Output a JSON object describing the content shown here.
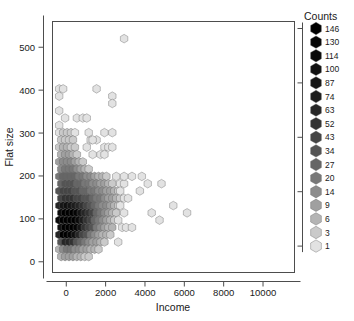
{
  "chart_data": {
    "type": "scatter",
    "subtype": "hexbin",
    "title": "",
    "xlabel": "Income",
    "ylabel": "Flat size",
    "xlim": [
      -700,
      11600
    ],
    "ylim": [
      -25,
      560
    ],
    "xticks": [
      0,
      2000,
      4000,
      6000,
      8000,
      10000
    ],
    "xticklabels": [
      "0",
      "2000",
      "4000",
      "6000",
      "8000",
      "10000"
    ],
    "yticks": [
      0,
      100,
      200,
      300,
      400,
      500
    ],
    "yticklabels": [
      "0",
      "100",
      "200",
      "300",
      "400",
      "500"
    ],
    "grid": false,
    "legend": {
      "title": "Counts",
      "position": "right",
      "entries": [
        {
          "value": 146,
          "color": "#000000"
        },
        {
          "value": 130,
          "color": "#050505"
        },
        {
          "value": 114,
          "color": "#0a0a0a"
        },
        {
          "value": 100,
          "color": "#101010"
        },
        {
          "value": 87,
          "color": "#161616"
        },
        {
          "value": 74,
          "color": "#1d1d1d"
        },
        {
          "value": 63,
          "color": "#262626"
        },
        {
          "value": 52,
          "color": "#333333"
        },
        {
          "value": 43,
          "color": "#454545"
        },
        {
          "value": 34,
          "color": "#545454"
        },
        {
          "value": 27,
          "color": "#666666"
        },
        {
          "value": 20,
          "color": "#787878"
        },
        {
          "value": 14,
          "color": "#8c8c8c"
        },
        {
          "value": 9,
          "color": "#a0a0a0"
        },
        {
          "value": 6,
          "color": "#b4b4b4"
        },
        {
          "value": 3,
          "color": "#cacaca"
        },
        {
          "value": 1,
          "color": "#e2e2e2"
        }
      ]
    },
    "hex_radius_px": 4.3,
    "bins": [
      {
        "x": -360,
        "y": 403,
        "c": 2
      },
      {
        "x": -360,
        "y": 386,
        "c": 1
      },
      {
        "x": -160,
        "y": 403,
        "c": 2
      },
      {
        "x": -360,
        "y": 352,
        "c": 1
      },
      {
        "x": -360,
        "y": 318,
        "c": 1
      },
      {
        "x": -360,
        "y": 301,
        "c": 2
      },
      {
        "x": -160,
        "y": 301,
        "c": 3
      },
      {
        "x": 40,
        "y": 301,
        "c": 3
      },
      {
        "x": 240,
        "y": 301,
        "c": 3
      },
      {
        "x": 440,
        "y": 301,
        "c": 2
      },
      {
        "x": -60,
        "y": 335,
        "c": 1
      },
      {
        "x": 540,
        "y": 335,
        "c": 2
      },
      {
        "x": 840,
        "y": 335,
        "c": 2
      },
      {
        "x": 1040,
        "y": 335,
        "c": 2
      },
      {
        "x": 1540,
        "y": 403,
        "c": 2
      },
      {
        "x": 2340,
        "y": 386,
        "c": 2
      },
      {
        "x": 2340,
        "y": 369,
        "c": 1
      },
      {
        "x": 2940,
        "y": 520,
        "c": 1
      },
      {
        "x": -260,
        "y": 284,
        "c": 3
      },
      {
        "x": -60,
        "y": 284,
        "c": 4
      },
      {
        "x": 140,
        "y": 284,
        "c": 4
      },
      {
        "x": 340,
        "y": 284,
        "c": 3
      },
      {
        "x": -360,
        "y": 267,
        "c": 4
      },
      {
        "x": -160,
        "y": 267,
        "c": 6
      },
      {
        "x": 40,
        "y": 267,
        "c": 6
      },
      {
        "x": 240,
        "y": 267,
        "c": 5
      },
      {
        "x": 440,
        "y": 267,
        "c": 3
      },
      {
        "x": -260,
        "y": 250,
        "c": 6
      },
      {
        "x": -60,
        "y": 250,
        "c": 9
      },
      {
        "x": 140,
        "y": 250,
        "c": 9
      },
      {
        "x": 340,
        "y": 250,
        "c": 6
      },
      {
        "x": 540,
        "y": 250,
        "c": 4
      },
      {
        "x": -360,
        "y": 233,
        "c": 9
      },
      {
        "x": -160,
        "y": 233,
        "c": 14
      },
      {
        "x": 40,
        "y": 233,
        "c": 14
      },
      {
        "x": 240,
        "y": 233,
        "c": 14
      },
      {
        "x": 440,
        "y": 233,
        "c": 9
      },
      {
        "x": 640,
        "y": 233,
        "c": 6
      },
      {
        "x": 840,
        "y": 233,
        "c": 3
      },
      {
        "x": -260,
        "y": 216,
        "c": 14
      },
      {
        "x": -60,
        "y": 216,
        "c": 20
      },
      {
        "x": 140,
        "y": 216,
        "c": 20
      },
      {
        "x": 340,
        "y": 216,
        "c": 20
      },
      {
        "x": 540,
        "y": 216,
        "c": 14
      },
      {
        "x": 740,
        "y": 216,
        "c": 9
      },
      {
        "x": 940,
        "y": 216,
        "c": 6
      },
      {
        "x": 1140,
        "y": 216,
        "c": 3
      },
      {
        "x": -360,
        "y": 199,
        "c": 20
      },
      {
        "x": -160,
        "y": 199,
        "c": 27
      },
      {
        "x": 40,
        "y": 199,
        "c": 27
      },
      {
        "x": 240,
        "y": 199,
        "c": 27
      },
      {
        "x": 440,
        "y": 199,
        "c": 27
      },
      {
        "x": 640,
        "y": 199,
        "c": 20
      },
      {
        "x": 840,
        "y": 199,
        "c": 20
      },
      {
        "x": 1040,
        "y": 199,
        "c": 14
      },
      {
        "x": 1240,
        "y": 199,
        "c": 14
      },
      {
        "x": 1440,
        "y": 199,
        "c": 9
      },
      {
        "x": 1640,
        "y": 199,
        "c": 6
      },
      {
        "x": 1840,
        "y": 199,
        "c": 6
      },
      {
        "x": 2040,
        "y": 199,
        "c": 3
      },
      {
        "x": -260,
        "y": 182,
        "c": 27
      },
      {
        "x": -60,
        "y": 182,
        "c": 34
      },
      {
        "x": 140,
        "y": 182,
        "c": 34
      },
      {
        "x": 340,
        "y": 182,
        "c": 34
      },
      {
        "x": 540,
        "y": 182,
        "c": 27
      },
      {
        "x": 740,
        "y": 182,
        "c": 27
      },
      {
        "x": 940,
        "y": 182,
        "c": 20
      },
      {
        "x": 1140,
        "y": 182,
        "c": 20
      },
      {
        "x": 1340,
        "y": 182,
        "c": 14
      },
      {
        "x": 1540,
        "y": 182,
        "c": 14
      },
      {
        "x": 1740,
        "y": 182,
        "c": 9
      },
      {
        "x": 1940,
        "y": 182,
        "c": 9
      },
      {
        "x": 2140,
        "y": 182,
        "c": 6
      },
      {
        "x": 2340,
        "y": 182,
        "c": 3
      },
      {
        "x": -360,
        "y": 165,
        "c": 34
      },
      {
        "x": -160,
        "y": 165,
        "c": 43
      },
      {
        "x": 40,
        "y": 165,
        "c": 43
      },
      {
        "x": 240,
        "y": 165,
        "c": 43
      },
      {
        "x": 440,
        "y": 165,
        "c": 34
      },
      {
        "x": 640,
        "y": 165,
        "c": 34
      },
      {
        "x": 840,
        "y": 165,
        "c": 27
      },
      {
        "x": 1040,
        "y": 165,
        "c": 27
      },
      {
        "x": 1240,
        "y": 165,
        "c": 20
      },
      {
        "x": 1440,
        "y": 165,
        "c": 20
      },
      {
        "x": 1640,
        "y": 165,
        "c": 14
      },
      {
        "x": 1840,
        "y": 165,
        "c": 14
      },
      {
        "x": 2040,
        "y": 165,
        "c": 9
      },
      {
        "x": 2240,
        "y": 165,
        "c": 9
      },
      {
        "x": 2440,
        "y": 165,
        "c": 6
      },
      {
        "x": 2640,
        "y": 165,
        "c": 3
      },
      {
        "x": -260,
        "y": 148,
        "c": 43
      },
      {
        "x": -60,
        "y": 148,
        "c": 52
      },
      {
        "x": 140,
        "y": 148,
        "c": 52
      },
      {
        "x": 340,
        "y": 148,
        "c": 52
      },
      {
        "x": 540,
        "y": 148,
        "c": 43
      },
      {
        "x": 740,
        "y": 148,
        "c": 43
      },
      {
        "x": 940,
        "y": 148,
        "c": 34
      },
      {
        "x": 1140,
        "y": 148,
        "c": 34
      },
      {
        "x": 1340,
        "y": 148,
        "c": 27
      },
      {
        "x": 1540,
        "y": 148,
        "c": 20
      },
      {
        "x": 1740,
        "y": 148,
        "c": 20
      },
      {
        "x": 1940,
        "y": 148,
        "c": 14
      },
      {
        "x": 2140,
        "y": 148,
        "c": 9
      },
      {
        "x": 2340,
        "y": 148,
        "c": 9
      },
      {
        "x": 2540,
        "y": 148,
        "c": 6
      },
      {
        "x": 2740,
        "y": 148,
        "c": 3
      },
      {
        "x": -360,
        "y": 131,
        "c": 63
      },
      {
        "x": -160,
        "y": 131,
        "c": 87
      },
      {
        "x": 40,
        "y": 131,
        "c": 100
      },
      {
        "x": 240,
        "y": 131,
        "c": 87
      },
      {
        "x": 440,
        "y": 131,
        "c": 74
      },
      {
        "x": 640,
        "y": 131,
        "c": 63
      },
      {
        "x": 840,
        "y": 131,
        "c": 52
      },
      {
        "x": 1040,
        "y": 131,
        "c": 43
      },
      {
        "x": 1240,
        "y": 131,
        "c": 34
      },
      {
        "x": 1440,
        "y": 131,
        "c": 27
      },
      {
        "x": 1640,
        "y": 131,
        "c": 20
      },
      {
        "x": 1840,
        "y": 131,
        "c": 14
      },
      {
        "x": 2040,
        "y": 131,
        "c": 14
      },
      {
        "x": 2240,
        "y": 131,
        "c": 9
      },
      {
        "x": 2440,
        "y": 131,
        "c": 6
      },
      {
        "x": 2640,
        "y": 131,
        "c": 3
      },
      {
        "x": -260,
        "y": 114,
        "c": 114
      },
      {
        "x": -60,
        "y": 114,
        "c": 146
      },
      {
        "x": 140,
        "y": 114,
        "c": 146
      },
      {
        "x": 340,
        "y": 114,
        "c": 146
      },
      {
        "x": 540,
        "y": 114,
        "c": 130
      },
      {
        "x": 740,
        "y": 114,
        "c": 87
      },
      {
        "x": 940,
        "y": 114,
        "c": 63
      },
      {
        "x": 1140,
        "y": 114,
        "c": 52
      },
      {
        "x": 1340,
        "y": 114,
        "c": 43
      },
      {
        "x": 1540,
        "y": 114,
        "c": 27
      },
      {
        "x": 1740,
        "y": 114,
        "c": 20
      },
      {
        "x": 1940,
        "y": 114,
        "c": 14
      },
      {
        "x": 2140,
        "y": 114,
        "c": 9
      },
      {
        "x": 2340,
        "y": 114,
        "c": 6
      },
      {
        "x": 2540,
        "y": 114,
        "c": 3
      },
      {
        "x": -360,
        "y": 97,
        "c": 114
      },
      {
        "x": -160,
        "y": 97,
        "c": 146
      },
      {
        "x": 40,
        "y": 97,
        "c": 146
      },
      {
        "x": 240,
        "y": 97,
        "c": 146
      },
      {
        "x": 440,
        "y": 97,
        "c": 146
      },
      {
        "x": 640,
        "y": 97,
        "c": 114
      },
      {
        "x": 840,
        "y": 97,
        "c": 74
      },
      {
        "x": 1040,
        "y": 97,
        "c": 52
      },
      {
        "x": 1240,
        "y": 97,
        "c": 43
      },
      {
        "x": 1440,
        "y": 97,
        "c": 27
      },
      {
        "x": 1640,
        "y": 97,
        "c": 20
      },
      {
        "x": 1840,
        "y": 97,
        "c": 14
      },
      {
        "x": 2040,
        "y": 97,
        "c": 9
      },
      {
        "x": 2240,
        "y": 97,
        "c": 6
      },
      {
        "x": 2440,
        "y": 97,
        "c": 3
      },
      {
        "x": -260,
        "y": 80,
        "c": 100
      },
      {
        "x": -60,
        "y": 80,
        "c": 146
      },
      {
        "x": 140,
        "y": 80,
        "c": 146
      },
      {
        "x": 340,
        "y": 80,
        "c": 146
      },
      {
        "x": 540,
        "y": 80,
        "c": 130
      },
      {
        "x": 740,
        "y": 80,
        "c": 87
      },
      {
        "x": 940,
        "y": 80,
        "c": 52
      },
      {
        "x": 1140,
        "y": 80,
        "c": 43
      },
      {
        "x": 1340,
        "y": 80,
        "c": 34
      },
      {
        "x": 1540,
        "y": 80,
        "c": 20
      },
      {
        "x": 1740,
        "y": 80,
        "c": 14
      },
      {
        "x": 1940,
        "y": 80,
        "c": 9
      },
      {
        "x": 2140,
        "y": 80,
        "c": 6
      },
      {
        "x": 2340,
        "y": 80,
        "c": 6
      },
      {
        "x": -360,
        "y": 63,
        "c": 63
      },
      {
        "x": -160,
        "y": 63,
        "c": 146
      },
      {
        "x": 40,
        "y": 63,
        "c": 146
      },
      {
        "x": 240,
        "y": 63,
        "c": 130
      },
      {
        "x": 440,
        "y": 63,
        "c": 100
      },
      {
        "x": 640,
        "y": 63,
        "c": 63
      },
      {
        "x": 840,
        "y": 63,
        "c": 43
      },
      {
        "x": 1040,
        "y": 63,
        "c": 34
      },
      {
        "x": 1240,
        "y": 63,
        "c": 20
      },
      {
        "x": 1440,
        "y": 63,
        "c": 14
      },
      {
        "x": 1640,
        "y": 63,
        "c": 9
      },
      {
        "x": 1840,
        "y": 63,
        "c": 6
      },
      {
        "x": 2040,
        "y": 63,
        "c": 6
      },
      {
        "x": 2240,
        "y": 63,
        "c": 3
      },
      {
        "x": -260,
        "y": 46,
        "c": 34
      },
      {
        "x": -60,
        "y": 46,
        "c": 63
      },
      {
        "x": 140,
        "y": 46,
        "c": 63
      },
      {
        "x": 340,
        "y": 46,
        "c": 52
      },
      {
        "x": 540,
        "y": 46,
        "c": 34
      },
      {
        "x": 740,
        "y": 46,
        "c": 27
      },
      {
        "x": 940,
        "y": 46,
        "c": 20
      },
      {
        "x": 1140,
        "y": 46,
        "c": 14
      },
      {
        "x": 1340,
        "y": 46,
        "c": 9
      },
      {
        "x": 1540,
        "y": 46,
        "c": 9
      },
      {
        "x": 1740,
        "y": 46,
        "c": 6
      },
      {
        "x": 1940,
        "y": 46,
        "c": 3
      },
      {
        "x": -360,
        "y": 29,
        "c": 6
      },
      {
        "x": -160,
        "y": 29,
        "c": 14
      },
      {
        "x": 40,
        "y": 29,
        "c": 20
      },
      {
        "x": 240,
        "y": 29,
        "c": 20
      },
      {
        "x": 440,
        "y": 29,
        "c": 14
      },
      {
        "x": 640,
        "y": 29,
        "c": 14
      },
      {
        "x": 840,
        "y": 29,
        "c": 9
      },
      {
        "x": 1040,
        "y": 29,
        "c": 9
      },
      {
        "x": 1240,
        "y": 29,
        "c": 6
      },
      {
        "x": 1440,
        "y": 29,
        "c": 6
      },
      {
        "x": 1640,
        "y": 29,
        "c": 3
      },
      {
        "x": -260,
        "y": 12,
        "c": 6
      },
      {
        "x": -60,
        "y": 12,
        "c": 9
      },
      {
        "x": 140,
        "y": 12,
        "c": 9
      },
      {
        "x": 340,
        "y": 12,
        "c": 9
      },
      {
        "x": 540,
        "y": 12,
        "c": 6
      },
      {
        "x": 740,
        "y": 12,
        "c": 6
      },
      {
        "x": 940,
        "y": 12,
        "c": 3
      },
      {
        "x": 1140,
        "y": 12,
        "c": 3
      },
      {
        "x": 2540,
        "y": 199,
        "c": 2
      },
      {
        "x": 2740,
        "y": 182,
        "c": 2
      },
      {
        "x": 2940,
        "y": 182,
        "c": 1
      },
      {
        "x": 2740,
        "y": 165,
        "c": 2
      },
      {
        "x": 2940,
        "y": 148,
        "c": 2
      },
      {
        "x": 3140,
        "y": 148,
        "c": 1
      },
      {
        "x": 2740,
        "y": 131,
        "c": 2
      },
      {
        "x": 2940,
        "y": 114,
        "c": 2
      },
      {
        "x": 2640,
        "y": 97,
        "c": 2
      },
      {
        "x": 2840,
        "y": 80,
        "c": 1
      },
      {
        "x": 3040,
        "y": 80,
        "c": 1
      },
      {
        "x": 2640,
        "y": 46,
        "c": 1
      },
      {
        "x": 3340,
        "y": 199,
        "c": 1
      },
      {
        "x": 3840,
        "y": 199,
        "c": 1
      },
      {
        "x": 4140,
        "y": 182,
        "c": 1
      },
      {
        "x": 3740,
        "y": 165,
        "c": 1
      },
      {
        "x": 4840,
        "y": 182,
        "c": 1
      },
      {
        "x": 4340,
        "y": 114,
        "c": 1
      },
      {
        "x": 4740,
        "y": 97,
        "c": 1
      },
      {
        "x": 5440,
        "y": 131,
        "c": 1
      },
      {
        "x": 6140,
        "y": 114,
        "c": 1
      },
      {
        "x": 3340,
        "y": 80,
        "c": 1
      },
      {
        "x": 1940,
        "y": 267,
        "c": 2
      },
      {
        "x": 2140,
        "y": 267,
        "c": 2
      },
      {
        "x": 2340,
        "y": 267,
        "c": 2
      },
      {
        "x": 1740,
        "y": 250,
        "c": 2
      },
      {
        "x": 1940,
        "y": 250,
        "c": 2
      },
      {
        "x": 1340,
        "y": 250,
        "c": 2
      },
      {
        "x": 1540,
        "y": 284,
        "c": 1
      },
      {
        "x": 1240,
        "y": 284,
        "c": 2
      },
      {
        "x": 1040,
        "y": 267,
        "c": 2
      },
      {
        "x": 1940,
        "y": 301,
        "c": 2
      },
      {
        "x": 2340,
        "y": 301,
        "c": 2
      },
      {
        "x": 1140,
        "y": 301,
        "c": 2
      },
      {
        "x": 1340,
        "y": 284,
        "c": 2
      },
      {
        "x": 2940,
        "y": 199,
        "c": 1
      }
    ]
  }
}
